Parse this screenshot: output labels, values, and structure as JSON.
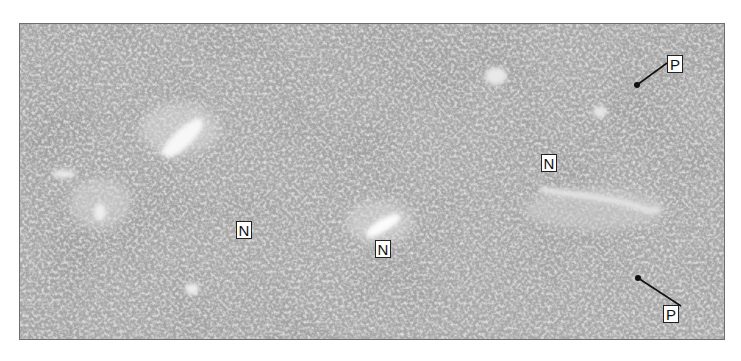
{
  "figure": {
    "labels": [
      {
        "id": "P-upper",
        "text": "P",
        "kind": "portal-area",
        "has_pointer": true
      },
      {
        "id": "N-right",
        "text": "N",
        "kind": "central-vein-region",
        "has_pointer": false
      },
      {
        "id": "N-left",
        "text": "N",
        "kind": "central-vein-region",
        "has_pointer": false
      },
      {
        "id": "N-center",
        "text": "N",
        "kind": "central-vein-region",
        "has_pointer": false
      },
      {
        "id": "P-lower",
        "text": "P",
        "kind": "portal-area",
        "has_pointer": true
      }
    ],
    "colors": {
      "tissue_base": "#a9a9a9",
      "tissue_dark": "#7d7d7d",
      "tissue_light": "#e6e6e6",
      "label_bg": "#ffffff",
      "label_border": "#222222",
      "pointer": "#111111"
    }
  }
}
